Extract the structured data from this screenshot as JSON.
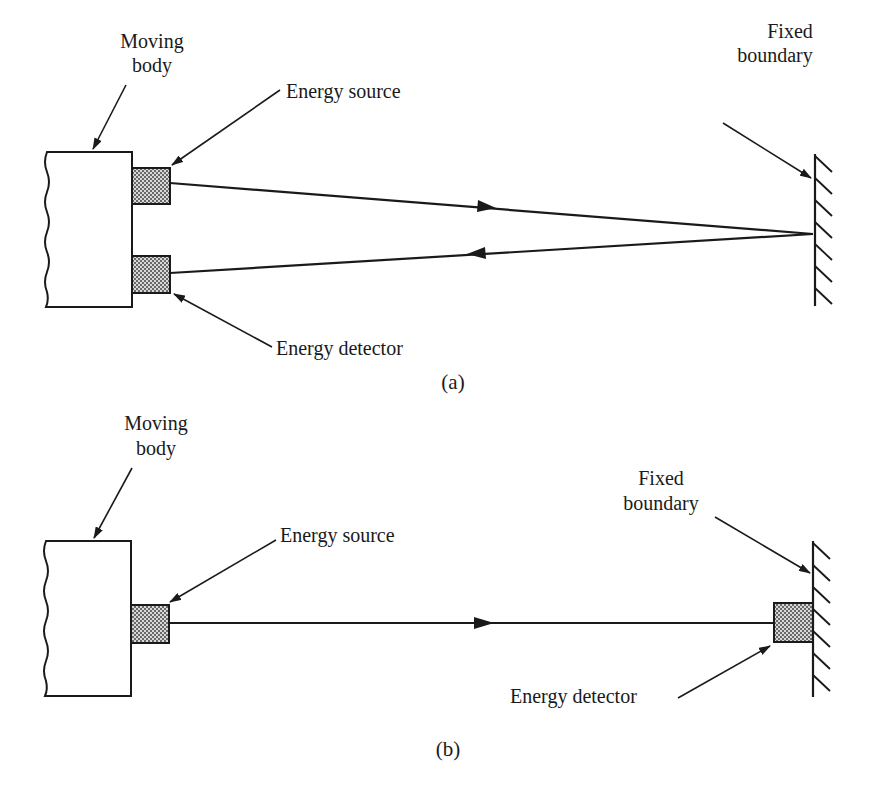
{
  "figure": {
    "panel_a": {
      "caption": "(a)",
      "labels": {
        "moving_body_line1": "Moving",
        "moving_body_line2": "body",
        "energy_source": "Energy source",
        "energy_detector": "Energy detector",
        "fixed_boundary_line1": "Fixed",
        "fixed_boundary_line2": "boundary"
      }
    },
    "panel_b": {
      "caption": "(b)",
      "labels": {
        "moving_body_line1": "Moving",
        "moving_body_line2": "body",
        "energy_source": "Energy source",
        "energy_detector": "Energy detector",
        "fixed_boundary_line1": "Fixed",
        "fixed_boundary_line2": "boundary"
      }
    },
    "colors": {
      "ink": "#1a1a1a",
      "background": "#ffffff",
      "stipple": "#9a9a9a"
    }
  }
}
